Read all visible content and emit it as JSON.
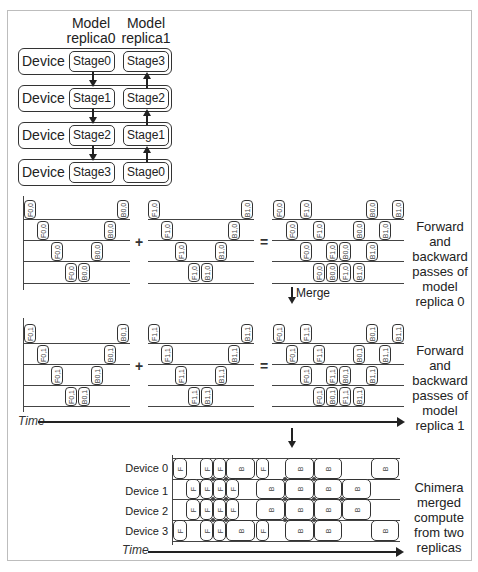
{
  "stage_mapping": {
    "headers": [
      {
        "line1": "Model",
        "line2": "replica0"
      },
      {
        "line1": "Model",
        "line2": "replica1"
      }
    ],
    "devices": [
      {
        "label": "Device 0",
        "replica0": "Stage0",
        "replica1": "Stage3"
      },
      {
        "label": "Device 1",
        "replica0": "Stage1",
        "replica1": "Stage2"
      },
      {
        "label": "Device 2",
        "replica0": "Stage2",
        "replica1": "Stage1"
      },
      {
        "label": "Device 3",
        "replica0": "Stage3",
        "replica1": "Stage0"
      }
    ]
  },
  "operators": {
    "plus": "+",
    "equals": "="
  },
  "replica0_caption": "Forward and backward passes of model replica 0",
  "replica1_caption": "Forward and backward passes of model replica 1",
  "merge_label": "Merge",
  "time_label": "Time",
  "chimera": {
    "devices": [
      "Device 0",
      "Device 1",
      "Device 2",
      "Device 3"
    ],
    "caption": "Chimera merged compute from two replicas"
  },
  "block_labels": {
    "f00": "F0,0",
    "b00": "B0,0",
    "f10": "F1,0",
    "b10": "B1,0",
    "f01": "F0,1",
    "b01": "B0,1",
    "f11": "F1,1",
    "b11": "B1,1",
    "f": "F",
    "b": "B"
  }
}
